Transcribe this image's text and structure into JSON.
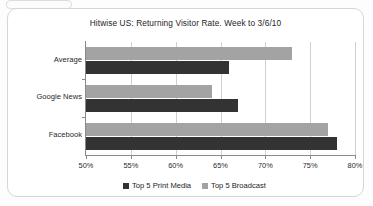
{
  "chart_data": {
    "type": "bar",
    "orientation": "horizontal",
    "title": "Hitwise US: Returning Visitor Rate. Week to 3/6/10",
    "xlabel": "",
    "ylabel": "",
    "categories": [
      "Average",
      "Google News",
      "Facebook"
    ],
    "series": [
      {
        "name": "Top 5 Print Media",
        "color": "#333333",
        "values": [
          66.0,
          67.0,
          78.0
        ]
      },
      {
        "name": "Top 5 Broadcast",
        "color": "#a3a3a3",
        "values": [
          73.0,
          64.0,
          77.0
        ]
      }
    ],
    "xlim": [
      50,
      80
    ],
    "xtick_labels": [
      "50%",
      "55%",
      "60%",
      "65%",
      "70%",
      "75%",
      "80%"
    ],
    "xtick_values": [
      50,
      55,
      60,
      65,
      70,
      75,
      80
    ],
    "grid": true,
    "legend_position": "bottom"
  },
  "legend": {
    "items": [
      {
        "label": "Top 5 Print Media",
        "color": "#333333"
      },
      {
        "label": "Top 5 Broadcast",
        "color": "#a3a3a3"
      }
    ]
  }
}
